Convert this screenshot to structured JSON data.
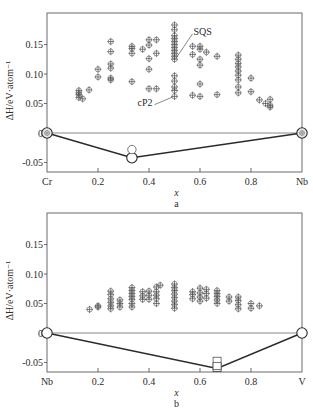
{
  "chart_data": [
    {
      "id": "a",
      "type": "scatter",
      "panel_label": "a",
      "xlabel": "x",
      "ylabel": "ΔH/eV·atom⁻¹",
      "xlim": [
        0,
        1
      ],
      "ylim": [
        -0.065,
        0.2
      ],
      "x_ticks": [
        {
          "value": 0,
          "label": "Cr"
        },
        {
          "value": 0.2,
          "label": "0.2"
        },
        {
          "value": 0.4,
          "label": "0.4"
        },
        {
          "value": 0.6,
          "label": "0.6"
        },
        {
          "value": 0.8,
          "label": "0.8"
        },
        {
          "value": 1,
          "label": "Nb"
        }
      ],
      "y_ticks": [
        {
          "value": 0.15,
          "label": "0.15"
        },
        {
          "value": 0.1,
          "label": "0.10"
        },
        {
          "value": 0.05,
          "label": "0.05"
        },
        {
          "value": 0,
          "label": "0"
        },
        {
          "value": -0.05,
          "label": "-0.05"
        }
      ],
      "annotations": [
        {
          "text": "SQS",
          "x": 0.5,
          "y": 0.135
        },
        {
          "text": "cP2",
          "x": 0.5,
          "y": 0.06
        }
      ],
      "convex_hull": {
        "x": [
          0,
          0.333,
          1
        ],
        "y": [
          0,
          -0.042,
          0
        ]
      },
      "hull_points_marker": "large-circle",
      "above_hull": [
        {
          "x": 0.333,
          "y": -0.028,
          "marker": "open-circle"
        }
      ],
      "series": [
        {
          "name": "structures",
          "marker": "circle-plus",
          "points": [
            [
              0.125,
              0.072
            ],
            [
              0.125,
              0.068
            ],
            [
              0.125,
              0.065
            ],
            [
              0.125,
              0.06
            ],
            [
              0.14,
              0.058
            ],
            [
              0.165,
              0.073
            ],
            [
              0.2,
              0.108
            ],
            [
              0.2,
              0.095
            ],
            [
              0.25,
              0.155
            ],
            [
              0.25,
              0.138
            ],
            [
              0.25,
              0.117
            ],
            [
              0.25,
              0.11
            ],
            [
              0.25,
              0.093
            ],
            [
              0.25,
              0.09
            ],
            [
              0.333,
              0.147
            ],
            [
              0.333,
              0.143
            ],
            [
              0.333,
              0.135
            ],
            [
              0.333,
              0.087
            ],
            [
              0.375,
              0.142
            ],
            [
              0.4,
              0.158
            ],
            [
              0.4,
              0.149
            ],
            [
              0.4,
              0.126
            ],
            [
              0.4,
              0.108
            ],
            [
              0.4,
              0.075
            ],
            [
              0.429,
              0.158
            ],
            [
              0.429,
              0.135
            ],
            [
              0.429,
              0.075
            ],
            [
              0.5,
              0.183
            ],
            [
              0.5,
              0.175
            ],
            [
              0.5,
              0.165
            ],
            [
              0.5,
              0.16
            ],
            [
              0.5,
              0.155
            ],
            [
              0.5,
              0.15
            ],
            [
              0.5,
              0.145
            ],
            [
              0.5,
              0.14
            ],
            [
              0.5,
              0.135
            ],
            [
              0.5,
              0.13
            ],
            [
              0.5,
              0.125
            ],
            [
              0.5,
              0.097
            ],
            [
              0.5,
              0.088
            ],
            [
              0.5,
              0.078
            ],
            [
              0.5,
              0.072
            ],
            [
              0.5,
              0.062
            ],
            [
              0.571,
              0.147
            ],
            [
              0.571,
              0.133
            ],
            [
              0.571,
              0.064
            ],
            [
              0.6,
              0.147
            ],
            [
              0.6,
              0.142
            ],
            [
              0.6,
              0.125
            ],
            [
              0.6,
              0.115
            ],
            [
              0.6,
              0.083
            ],
            [
              0.6,
              0.062
            ],
            [
              0.625,
              0.137
            ],
            [
              0.667,
              0.13
            ],
            [
              0.667,
              0.065
            ],
            [
              0.75,
              0.132
            ],
            [
              0.75,
              0.125
            ],
            [
              0.75,
              0.118
            ],
            [
              0.75,
              0.112
            ],
            [
              0.75,
              0.105
            ],
            [
              0.75,
              0.098
            ],
            [
              0.75,
              0.09
            ],
            [
              0.75,
              0.078
            ],
            [
              0.75,
              0.068
            ],
            [
              0.8,
              0.093
            ],
            [
              0.8,
              0.07
            ],
            [
              0.833,
              0.056
            ],
            [
              0.857,
              0.05
            ],
            [
              0.875,
              0.057
            ],
            [
              0.875,
              0.047
            ],
            [
              0.875,
              0.044
            ]
          ]
        }
      ]
    },
    {
      "id": "b",
      "type": "scatter",
      "panel_label": "b",
      "xlabel": "x",
      "ylabel": "ΔH/eV·atom⁻¹",
      "xlim": [
        0,
        1
      ],
      "ylim": [
        -0.065,
        0.2
      ],
      "x_ticks": [
        {
          "value": 0,
          "label": "Nb"
        },
        {
          "value": 0.2,
          "label": "0.2"
        },
        {
          "value": 0.4,
          "label": "0.4"
        },
        {
          "value": 0.6,
          "label": "0.6"
        },
        {
          "value": 0.8,
          "label": "0.8"
        },
        {
          "value": 1,
          "label": "V"
        }
      ],
      "y_ticks": [
        {
          "value": 0.15,
          "label": "0.15"
        },
        {
          "value": 0.1,
          "label": "0.10"
        },
        {
          "value": 0.05,
          "label": "0.05"
        },
        {
          "value": 0,
          "label": "0"
        },
        {
          "value": -0.05,
          "label": "-0.05"
        }
      ],
      "convex_hull": {
        "x": [
          0,
          0.667,
          1
        ],
        "y": [
          0,
          -0.06,
          0
        ]
      },
      "hull_points_marker": "large-circle",
      "above_hull": [
        {
          "x": 0.667,
          "y": -0.047,
          "marker": "open-square"
        },
        {
          "x": 0.667,
          "y": -0.056,
          "marker": "open-square"
        }
      ],
      "series": [
        {
          "name": "structures",
          "marker": "circle-plus",
          "points": [
            [
              0.167,
              0.04
            ],
            [
              0.2,
              0.046
            ],
            [
              0.2,
              0.044
            ],
            [
              0.25,
              0.071
            ],
            [
              0.25,
              0.065
            ],
            [
              0.25,
              0.058
            ],
            [
              0.25,
              0.052
            ],
            [
              0.25,
              0.046
            ],
            [
              0.25,
              0.041
            ],
            [
              0.286,
              0.056
            ],
            [
              0.286,
              0.05
            ],
            [
              0.286,
              0.044
            ],
            [
              0.333,
              0.077
            ],
            [
              0.333,
              0.072
            ],
            [
              0.333,
              0.067
            ],
            [
              0.333,
              0.062
            ],
            [
              0.333,
              0.057
            ],
            [
              0.333,
              0.05
            ],
            [
              0.333,
              0.044
            ],
            [
              0.375,
              0.07
            ],
            [
              0.375,
              0.063
            ],
            [
              0.375,
              0.057
            ],
            [
              0.4,
              0.071
            ],
            [
              0.4,
              0.064
            ],
            [
              0.4,
              0.057
            ],
            [
              0.429,
              0.078
            ],
            [
              0.429,
              0.07
            ],
            [
              0.429,
              0.064
            ],
            [
              0.429,
              0.058
            ],
            [
              0.429,
              0.05
            ],
            [
              0.444,
              0.081
            ],
            [
              0.5,
              0.083
            ],
            [
              0.5,
              0.077
            ],
            [
              0.5,
              0.072
            ],
            [
              0.5,
              0.066
            ],
            [
              0.5,
              0.06
            ],
            [
              0.5,
              0.054
            ],
            [
              0.5,
              0.048
            ],
            [
              0.5,
              0.042
            ],
            [
              0.571,
              0.07
            ],
            [
              0.571,
              0.065
            ],
            [
              0.571,
              0.058
            ],
            [
              0.6,
              0.076
            ],
            [
              0.6,
              0.068
            ],
            [
              0.6,
              0.061
            ],
            [
              0.6,
              0.054
            ],
            [
              0.625,
              0.074
            ],
            [
              0.625,
              0.067
            ],
            [
              0.625,
              0.059
            ],
            [
              0.667,
              0.072
            ],
            [
              0.667,
              0.067
            ],
            [
              0.667,
              0.062
            ],
            [
              0.667,
              0.056
            ],
            [
              0.667,
              0.05
            ],
            [
              0.714,
              0.061
            ],
            [
              0.714,
              0.054
            ],
            [
              0.75,
              0.061
            ],
            [
              0.75,
              0.055
            ],
            [
              0.75,
              0.048
            ],
            [
              0.75,
              0.041
            ],
            [
              0.8,
              0.05
            ],
            [
              0.8,
              0.042
            ],
            [
              0.833,
              0.046
            ]
          ]
        }
      ]
    }
  ],
  "layout": {
    "panels": [
      {
        "frame": {
          "left": 47,
          "right": 302,
          "top": 13,
          "bottom": 172
        },
        "zero_px": 133,
        "px_per_unit_y": 590
      },
      {
        "frame": {
          "left": 47,
          "right": 302,
          "top": 213,
          "bottom": 372
        },
        "zero_px": 333,
        "px_per_unit_y": 590
      }
    ]
  }
}
